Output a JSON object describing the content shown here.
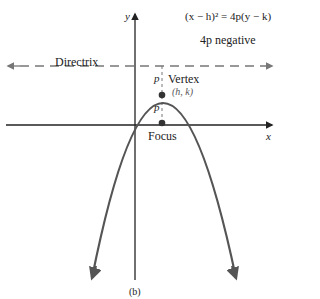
{
  "diagram": {
    "equation": "(x − h)² = 4p(y − k)",
    "condition": "4p negative",
    "directrix_label": "Directrix",
    "vertex_label": "Vertex",
    "vertex_coords": "(h, k)",
    "focus_label": "Focus",
    "p_upper": "p",
    "p_lower": "p",
    "x_axis_label": "x",
    "y_axis_label": "y",
    "caption": "(b)",
    "colors": {
      "curve": "#555555",
      "axes": "#222222",
      "dashes": "#777777",
      "points": "#333333"
    }
  }
}
